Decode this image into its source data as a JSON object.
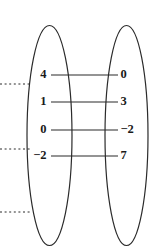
{
  "figure": {
    "kind": "mapping-diagram",
    "background_color": "#ffffff",
    "stroke_color": "#2b2b2b",
    "text_color": "#1a1a1a"
  },
  "domain_set": {
    "name": "left-oval",
    "cx": 49.5,
    "cy": 135.5,
    "rx": 22.5,
    "ry": 110
  },
  "codomain_set": {
    "name": "right-oval",
    "cx": 126.5,
    "cy": 135.5,
    "rx": 21.5,
    "ry": 110
  },
  "chart_data": {
    "type": "mapping",
    "title": "",
    "xlabel": "",
    "ylabel": "",
    "domain_values": [
      "4",
      "1",
      "0",
      "−2"
    ],
    "range_values": [
      "0",
      "3",
      "−2",
      "7"
    ],
    "pairs": [
      {
        "input": "4",
        "output": "0",
        "y": 75
      },
      {
        "input": "1",
        "output": "3",
        "y": 102
      },
      {
        "input": "0",
        "output": "−2",
        "y": 130
      },
      {
        "input": "−2",
        "output": "7",
        "y": 156
      }
    ],
    "connector_x_start": 51,
    "connector_x_end": 118
  },
  "crop_marks": {
    "name": "dotted-rules",
    "x_start": 0,
    "x_end": 30,
    "ys": [
      84,
      149,
      212
    ]
  }
}
